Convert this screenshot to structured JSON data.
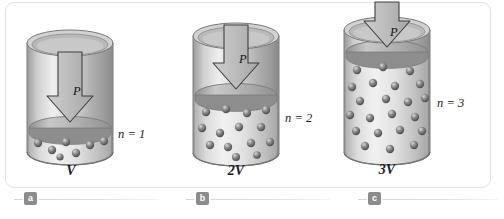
{
  "figure": {
    "kind": "gas-cylinder-piston-diagram",
    "panels": [
      {
        "id": "a",
        "volume_label": "V",
        "moles_label": "n = 1",
        "pressure_label": "P",
        "caption_badge": "a",
        "gas_molecule_count": 7,
        "gas_fill_fraction": 0.2,
        "cylinder_height_px": 118
      },
      {
        "id": "b",
        "volume_label": "2V",
        "moles_label": "n = 2",
        "pressure_label": "P",
        "caption_badge": "b",
        "gas_molecule_count": 14,
        "gas_fill_fraction": 0.42,
        "cylinder_height_px": 128
      },
      {
        "id": "c",
        "volume_label": "3V",
        "moles_label": "n = 3",
        "pressure_label": "P",
        "caption_badge": "c",
        "gas_molecule_count": 22,
        "gas_fill_fraction": 0.66,
        "cylinder_height_px": 140
      }
    ]
  },
  "colors": {
    "frame_border": "#e2e2e2",
    "cylinder_wall_light": "#f0f0f0",
    "cylinder_wall_mid": "#b6b6b6",
    "cylinder_wall_dark": "#8e8e8e",
    "piston_face": "#9d9d9d",
    "arrow_fill": "#b9b9b9",
    "arrow_stroke": "#4a4a4a",
    "molecule": "#6f6f6f",
    "text": "#1b1b1b",
    "badge_bg": "#8c8c8c",
    "rule": "#d6d6d6"
  }
}
